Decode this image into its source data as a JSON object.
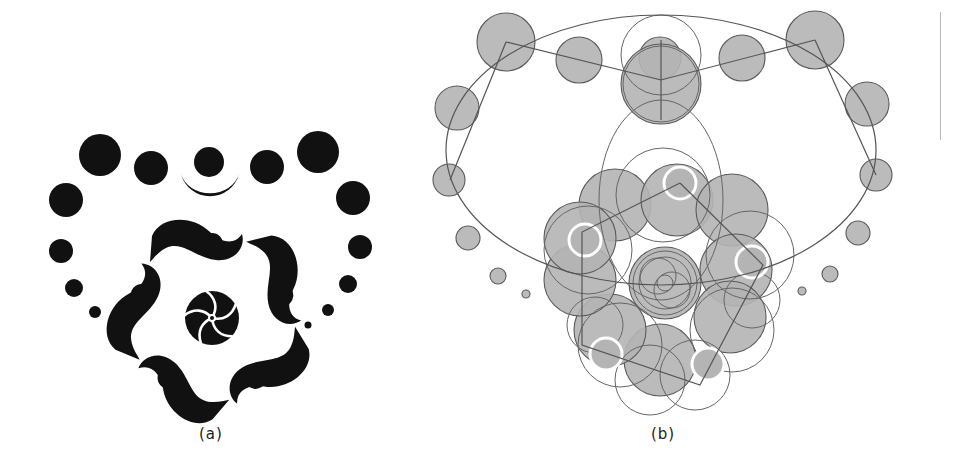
{
  "figure": {
    "panels": [
      {
        "id": "a",
        "caption": "(a)",
        "description": "Heart-shaped circle pattern with five-fold swirl motif, solid black fill",
        "fill_color": "#111111"
      },
      {
        "id": "b",
        "caption": "(b)",
        "description": "Construction diagram of the heart pattern: gray filled circles, outline guide circles and straight guide lines",
        "fill_color": "#b4b4b4",
        "stroke_color": "#555555"
      }
    ]
  },
  "colors": {
    "background": "#ffffff",
    "ink": "#111111",
    "gray_fill": "#b4b4b4",
    "guide_stroke": "#555555",
    "side_rule": "#b8b8b8"
  }
}
